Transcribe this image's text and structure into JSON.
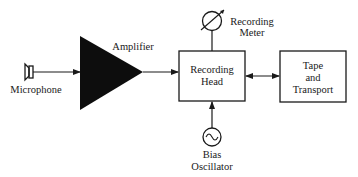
{
  "diagram": {
    "type": "block-diagram",
    "title": "",
    "nodes": [
      {
        "id": "microphone",
        "label": "Microphone",
        "shape": "microphone-symbol"
      },
      {
        "id": "amplifier",
        "label": "Amplifier",
        "shape": "filled-triangle"
      },
      {
        "id": "recording_head",
        "label_lines": [
          "Recording",
          "Head"
        ],
        "shape": "rectangle"
      },
      {
        "id": "recording_meter",
        "label_lines": [
          "Recording",
          "Meter"
        ],
        "shape": "meter-circle"
      },
      {
        "id": "tape_transport",
        "label_lines": [
          "Tape",
          "and",
          "Transport"
        ],
        "shape": "rectangle"
      },
      {
        "id": "bias_oscillator",
        "label_lines": [
          "Bias",
          "Oscillator"
        ],
        "shape": "ac-source-circle"
      }
    ],
    "edges": [
      {
        "from": "microphone",
        "to": "amplifier",
        "style": "arrow"
      },
      {
        "from": "amplifier",
        "to": "recording_head",
        "style": "arrow"
      },
      {
        "from": "recording_meter",
        "to": "recording_head",
        "style": "line"
      },
      {
        "from": "recording_head",
        "to": "tape_transport",
        "style": "double-arrow"
      },
      {
        "from": "bias_oscillator",
        "to": "recording_head",
        "style": "arrow"
      }
    ]
  },
  "labels": {
    "microphone": "Microphone",
    "amplifier": "Amplifier",
    "recording_head_1": "Recording",
    "recording_head_2": "Head",
    "meter_1": "Recording",
    "meter_2": "Meter",
    "tape_1": "Tape",
    "tape_2": "and",
    "tape_3": "Transport",
    "bias_1": "Bias",
    "bias_2": "Oscillator"
  },
  "colors": {
    "ink": "#1a1a1a",
    "background": "#ffffff"
  }
}
